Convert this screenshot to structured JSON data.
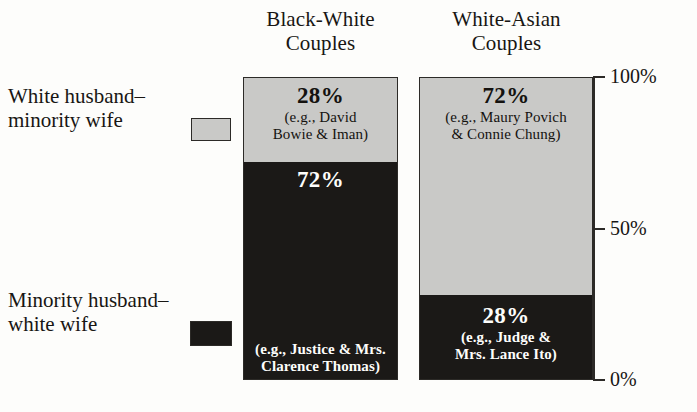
{
  "chart_data": {
    "type": "bar",
    "subtype": "100% stacked column",
    "title": "",
    "xlabel": "",
    "ylabel": "",
    "ylim": [
      0,
      100
    ],
    "grid": false,
    "legend_position": "left",
    "axis_ticks": [
      "100%",
      "50%",
      "0%"
    ],
    "axis_tick_values": [
      100,
      50,
      0
    ],
    "categories": [
      "Black-White Couples",
      "White-Asian Couples"
    ],
    "series": [
      {
        "name": "White husband–minority wife",
        "color": "#c9c9c7",
        "values": [
          28,
          72
        ],
        "labels": [
          "28%",
          "72%"
        ],
        "annotations": [
          "(e.g., David\nBowie & Iman)",
          "(e.g., Maury Povich\n& Connie Chung)"
        ]
      },
      {
        "name": "Minority husband–white wife",
        "color": "#1b1917",
        "values": [
          72,
          28
        ],
        "labels": [
          "72%",
          "28%"
        ],
        "annotations": [
          "(e.g., Justice & Mrs.\nClarence Thomas)",
          "(e.g., Judge &\nMrs. Lance Ito)"
        ]
      }
    ]
  },
  "headers": {
    "left": "Black-White\nCouples",
    "right": "White-Asian\nCouples"
  },
  "legend": {
    "light": {
      "label": "White husband–\nminority wife",
      "color": "#c9c9c7"
    },
    "dark": {
      "label": "Minority husband–\nwhite wife",
      "color": "#1b1917"
    }
  },
  "axis": {
    "top": "100%",
    "mid": "50%",
    "bottom": "0%"
  },
  "bars": {
    "left": {
      "top_segment": {
        "pct": "28%",
        "example": "(e.g., David\nBowie & Iman)"
      },
      "bottom_segment": {
        "pct": "72%",
        "example": "(e.g., Justice & Mrs.\nClarence Thomas)"
      }
    },
    "right": {
      "top_segment": {
        "pct": "72%",
        "example": "(e.g., Maury Povich\n& Connie Chung)"
      },
      "bottom_segment": {
        "pct": "28%",
        "example": "(e.g., Judge &\nMrs. Lance Ito)"
      }
    }
  }
}
